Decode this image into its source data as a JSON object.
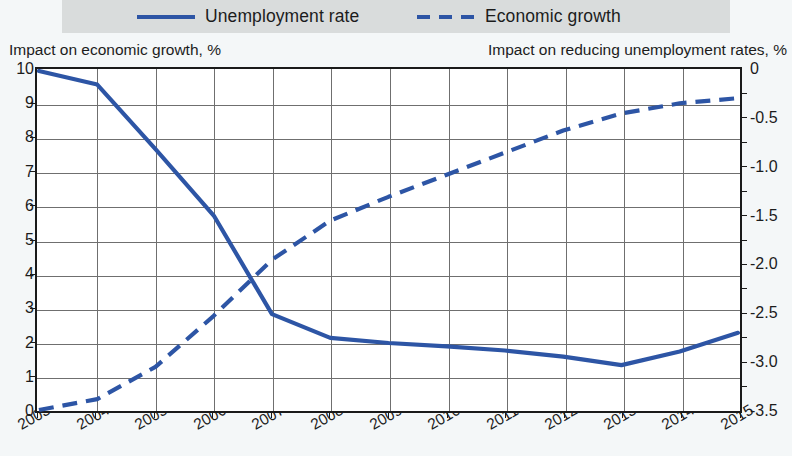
{
  "legend": {
    "items": [
      {
        "label": "Unemployment rate",
        "style": "solid",
        "color": "#2d55a5",
        "icon": "solid-line-swatch"
      },
      {
        "label": "Economic growth",
        "style": "dashed",
        "color": "#2d55a5",
        "icon": "dashed-line-swatch"
      }
    ]
  },
  "axis_titles": {
    "left": "Impact on economic growth, %",
    "right": "Impact on reducing unemployment rates, %"
  },
  "chart_data": {
    "type": "line",
    "title": "",
    "subtitle": "",
    "xlabel": "",
    "ylabel": "Impact on economic growth, %",
    "y2label": "Impact on reducing unemployment rates, %",
    "grid": true,
    "legend_position": "top",
    "x": [
      2003,
      2004,
      2005,
      2006,
      2007,
      2008,
      2009,
      2010,
      2011,
      2012,
      2013,
      2014,
      2015
    ],
    "categories": [
      "2003",
      "2004",
      "2005",
      "2006",
      "2007",
      "2008",
      "2009",
      "2010",
      "2011",
      "2012",
      "2013",
      "2014",
      "2015"
    ],
    "ylim": [
      0,
      10
    ],
    "yticks": [
      0,
      1,
      2,
      3,
      4,
      5,
      6,
      7,
      8,
      9,
      10
    ],
    "ytick_labels": [
      "0",
      "1",
      "2",
      "3",
      "4",
      "5",
      "6",
      "7",
      "8",
      "9",
      "10"
    ],
    "y2lim": [
      -3.5,
      0
    ],
    "y2ticks": [
      -3.5,
      -3.0,
      -2.5,
      -2.0,
      -1.5,
      -1.0,
      -0.5,
      0
    ],
    "y2tick_labels": [
      "-3.5",
      "-3.0",
      "-2.5",
      "-2.0",
      "-1.5",
      "-1.0",
      "-0.5",
      "0"
    ],
    "series": [
      {
        "name": "Unemployment rate",
        "style": "solid",
        "color": "#2d55a5",
        "axis": "left",
        "values": [
          10.0,
          9.6,
          7.7,
          5.75,
          2.85,
          2.15,
          2.0,
          1.9,
          1.78,
          1.6,
          1.35,
          1.75,
          2.3
        ]
      },
      {
        "name": "Economic growth",
        "style": "dashed",
        "color": "#2d55a5",
        "axis": "left",
        "values": [
          0.03,
          0.35,
          1.3,
          2.8,
          4.45,
          5.6,
          6.3,
          6.95,
          7.6,
          8.25,
          8.75,
          9.05,
          9.2
        ],
        "values_right_axis": [
          -3.49,
          -3.38,
          -3.05,
          -2.52,
          -1.94,
          -1.54,
          -1.3,
          -1.07,
          -0.84,
          -0.61,
          -0.44,
          -0.33,
          -0.28
        ]
      }
    ]
  }
}
